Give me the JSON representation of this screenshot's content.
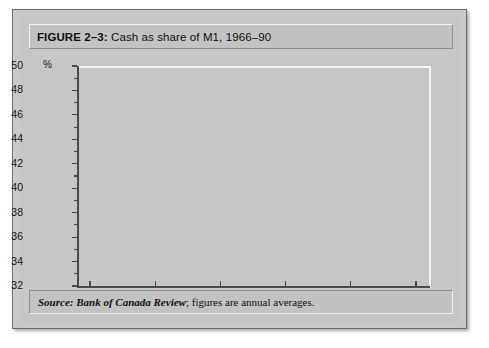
{
  "figure": {
    "label": "FIGURE 2–3:",
    "title": " Cash as share of M1, 1966–90",
    "source_prefix": "Source:",
    "source_italic": " Bank of Canada Review",
    "source_rest": "; figures are annual averages."
  },
  "chart_data": {
    "type": "line",
    "title": "Cash as share of M1, 1966–90",
    "xlabel": "",
    "ylabel": "%",
    "unit": "%",
    "xlim": [
      1964,
      1991
    ],
    "ylim": [
      32,
      50
    ],
    "xticks": [
      1965,
      1970,
      1975,
      1980,
      1985,
      1990
    ],
    "xticklabels": [
      "1965",
      "1970",
      "1975",
      "1980",
      "1985",
      "1990"
    ],
    "yticks": [
      32,
      34,
      36,
      38,
      40,
      42,
      44,
      46,
      48,
      50
    ],
    "yticklabels": [
      "32",
      "34",
      "36",
      "38",
      "40",
      "42",
      "44",
      "46",
      "48",
      "50"
    ],
    "yminorticks": [
      33,
      35,
      37,
      39,
      41,
      43,
      45,
      47,
      49
    ],
    "grid": false,
    "legend": false,
    "line_color": "#3a3a3a",
    "x": [
      1966,
      1967,
      1968,
      1969,
      1970,
      1971,
      1972,
      1973,
      1974,
      1975,
      1976,
      1977,
      1978,
      1979,
      1980,
      1981,
      1982,
      1983,
      1984,
      1985,
      1986,
      1987,
      1988,
      1989,
      1990
    ],
    "values": [
      32.8,
      32.8,
      33.9,
      35.0,
      36.1,
      35.0,
      34.5,
      34.4,
      36.8,
      36.9,
      37.4,
      37.6,
      38.2,
      38.4,
      39.4,
      40.8,
      42.2,
      41.9,
      43.5,
      44.8,
      46.0,
      43.7,
      43.9,
      45.4,
      49.0
    ]
  }
}
